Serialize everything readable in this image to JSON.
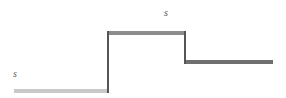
{
  "figure": {
    "type": "step-diagram",
    "title": "",
    "width": 286,
    "height": 98,
    "background_color": "#ffffff"
  },
  "colors": {
    "tread_low": "#c9c9c9",
    "tread_mid": "#8d8d8d",
    "tread_high": "#6f6f6f",
    "riser": "#555555",
    "label": "#555555",
    "background": "#ffffff"
  },
  "steps": [
    {
      "name": "lower-step",
      "level": "low",
      "x": 14,
      "y": 89,
      "width": 94,
      "height": 4,
      "color": "#c9c9c9"
    },
    {
      "name": "middle-step",
      "level": "mid",
      "x": 107,
      "y": 31,
      "width": 79,
      "height": 4,
      "color": "#8d8d8d"
    },
    {
      "name": "upper-step",
      "level": "high",
      "x": 186,
      "y": 60,
      "width": 87,
      "height": 4,
      "color": "#6f6f6f"
    }
  ],
  "risers": [
    {
      "name": "left-riser",
      "x": 107,
      "y": 31,
      "width": 2,
      "height": 62,
      "color": "#555555"
    },
    {
      "name": "right-riser",
      "x": 184,
      "y": 31,
      "width": 2,
      "height": 33,
      "color": "#555555"
    }
  ],
  "labels": [
    {
      "name": "label-lower",
      "text": "s",
      "x": 13,
      "y": 69,
      "color": "#555555"
    },
    {
      "name": "label-upper",
      "text": "s",
      "x": 164,
      "y": 8,
      "color": "#555555"
    }
  ]
}
